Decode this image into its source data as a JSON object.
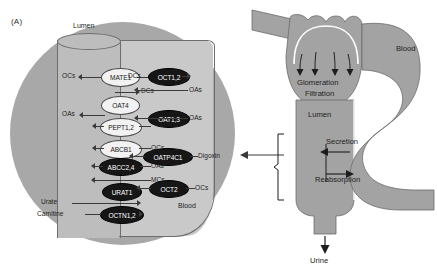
{
  "figure": {
    "panel_letter": "(A)",
    "background_color": "#ffffff"
  },
  "cell_panel": {
    "name": "renal-proximal-tubule-cell",
    "colors": {
      "outer_cell": "#a8a8a8",
      "inner_cell": "#c9c9c9",
      "lumen": "#bdbdbd",
      "light_transporter": "#f2f2f2",
      "dark_transporter": "#161616"
    },
    "region_labels": {
      "lumen": "Lumen",
      "blood": "Blood"
    },
    "apical_transporters": [
      {
        "name": "MATE1",
        "style": "light",
        "left_substrate": "OCs",
        "right_substrate": "DCs"
      },
      {
        "name": "OAT4",
        "style": "light",
        "left_substrate": "OAs",
        "right_substrate": ""
      },
      {
        "name": "PEPT1,2",
        "style": "light",
        "left_substrate": "",
        "right_substrate": ""
      },
      {
        "name": "ABCB1",
        "style": "light",
        "left_substrate": "",
        "right_substrate": "OCs"
      },
      {
        "name": "ABCC2,4",
        "style": "dark",
        "left_substrate": "",
        "right_substrate": "OAs"
      },
      {
        "name": "URAT1",
        "style": "dark",
        "left_substrate": "Urate",
        "right_substrate": "MCs"
      },
      {
        "name": "OCTN1,2",
        "style": "dark",
        "left_substrate": "Carnitine",
        "right_substrate": ""
      }
    ],
    "basolateral_transporters": [
      {
        "name": "OCT1,2",
        "style": "dark",
        "left_substrate": "DCs",
        "right_substrate": "OAs"
      },
      {
        "name": "OAT1,3",
        "style": "dark",
        "left_substrate": "",
        "right_substrate": "OAs"
      },
      {
        "name": "OATP4C1",
        "style": "dark",
        "left_substrate": "",
        "right_substrate": "Digoxin"
      },
      {
        "name": "OCT2",
        "style": "dark",
        "left_substrate": "",
        "right_substrate": "OCs"
      }
    ]
  },
  "nephron_panel": {
    "name": "nephron-schematic",
    "colors": {
      "tissue": "#a3a3a3",
      "stroke": "#6b6b6b"
    },
    "labels": {
      "blood": "Blood",
      "glomeration": "Glomeration",
      "filtration": "Filtration",
      "lumen": "Lumen",
      "secretion": "Secretion",
      "reabsorption": "Reabsorption",
      "urine": "Urine"
    }
  }
}
